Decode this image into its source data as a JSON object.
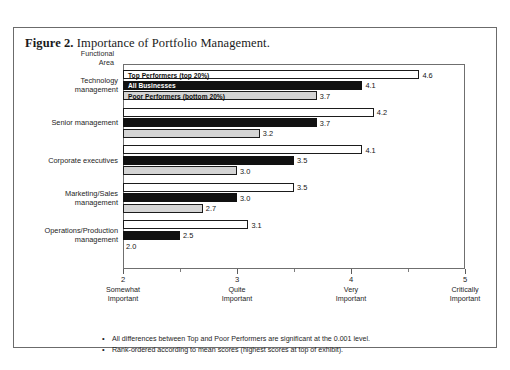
{
  "figure": {
    "label": "Figure 2.",
    "title": "Importance of Portfolio Management."
  },
  "axis_group_label": "Functional\nArea",
  "notes": [
    "All differences between Top and Poor Performers are significant at the 0.001 level.",
    "Rank-ordered according to mean scores (highest scores at top of exhibit)."
  ],
  "bullet_glyph": "•",
  "chart_data": {
    "type": "bar",
    "orientation": "horizontal",
    "title": "Importance of Portfolio Management.",
    "xlabel": "",
    "ylabel": "Functional Area",
    "xlim": [
      2,
      5
    ],
    "grid": false,
    "legend_position": "inside-top-bars",
    "xticks": [
      2,
      3,
      4,
      5
    ],
    "xtick_labels": [
      "2",
      "3",
      "4",
      "5"
    ],
    "xtick_descriptions": [
      "Somewhat\nImportant",
      "Quite\nImportant",
      "Very\nImportant",
      "Critically\nImportant"
    ],
    "xtick_minor": [
      2.5,
      3.5,
      4.5
    ],
    "categories": [
      "Technology\nmanagement",
      "Senior management",
      "Corporate executives",
      "Marketing/Sales\nmanagement",
      "Operations/Production\nmanagement"
    ],
    "series": [
      {
        "name": "Top Performers (top 20%)",
        "fill": "#ffffff",
        "text_color": "#0d0d0d",
        "values": [
          4.6,
          4.2,
          4.1,
          3.5,
          3.1
        ]
      },
      {
        "name": "All Businesses",
        "fill": "#111111",
        "text_color": "#ffffff",
        "values": [
          4.1,
          3.7,
          3.5,
          3.0,
          2.5
        ]
      },
      {
        "name": "Poor Performers (bottom 20%)",
        "fill": "#d4d4d4",
        "text_color": "#0d0d0d",
        "values": [
          3.7,
          3.2,
          3.0,
          2.7,
          2.0
        ]
      }
    ],
    "value_labels": [
      [
        "4.6",
        "4.1",
        "3.7"
      ],
      [
        "4.2",
        "3.7",
        "3.2"
      ],
      [
        "4.1",
        "3.5",
        "3.0"
      ],
      [
        "3.5",
        "3.0",
        "2.7"
      ],
      [
        "3.1",
        "2.5",
        "2.0"
      ]
    ]
  }
}
